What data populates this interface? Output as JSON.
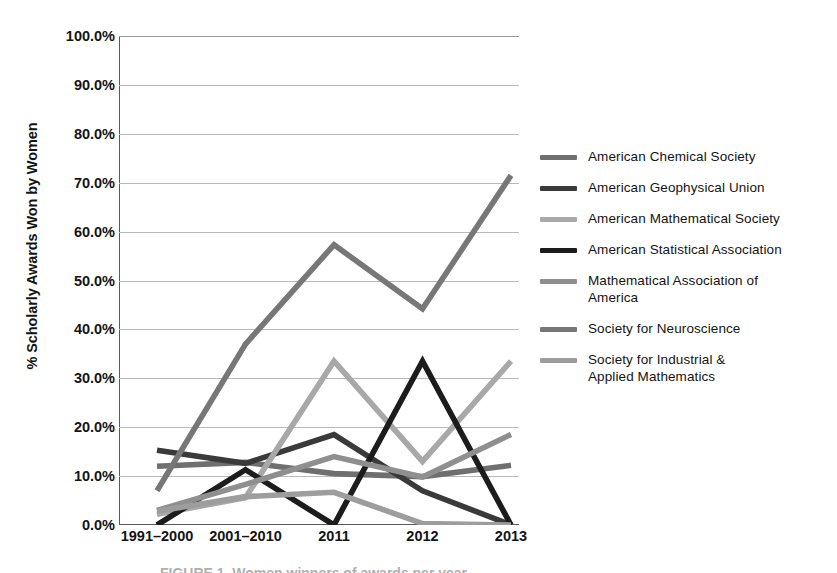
{
  "chart_data": {
    "type": "line",
    "title": "",
    "xlabel": "",
    "ylabel": "% Scholarly Awards Won by Women",
    "categories": [
      "1991–2000",
      "2001–2010",
      "2011",
      "2012",
      "2013"
    ],
    "ylim": [
      0,
      100
    ],
    "y_ticks": [
      "0.0%",
      "10.0%",
      "20.0%",
      "30.0%",
      "40.0%",
      "50.0%",
      "60.0%",
      "70.0%",
      "80.0%",
      "90.0%",
      "100.0%"
    ],
    "y_tick_values": [
      0,
      10,
      20,
      30,
      40,
      50,
      60,
      70,
      80,
      90,
      100
    ],
    "grid": true,
    "legend_position": "right",
    "series": [
      {
        "name": "American Chemical Society",
        "color": "#6f6f6f",
        "values": [
          12.0,
          12.8,
          10.5,
          9.9,
          12.2
        ]
      },
      {
        "name": "American Geophysical Union",
        "color": "#3a3a3a",
        "values": [
          15.3,
          12.6,
          18.5,
          7.0,
          0.0
        ]
      },
      {
        "name": "American Mathematical Society",
        "color": "#a8a8a8",
        "values": [
          2.2,
          5.6,
          33.5,
          13.0,
          33.5
        ]
      },
      {
        "name": "American Statistical Association",
        "color": "#1c1c1c",
        "values": [
          0.0,
          11.3,
          0.0,
          33.5,
          0.0
        ]
      },
      {
        "name": "Mathematical Association of\nAmerica",
        "color": "#8f8f8f",
        "values": [
          3.0,
          8.3,
          14.0,
          9.8,
          18.5
        ]
      },
      {
        "name": "Society for Neuroscience",
        "color": "#777777",
        "values": [
          7.0,
          37.0,
          57.3,
          44.2,
          71.5
        ]
      },
      {
        "name": "Society for Industrial &\nApplied Mathematics",
        "color": "#9d9d9d",
        "values": [
          2.8,
          5.8,
          6.7,
          0.3,
          0.0
        ]
      }
    ]
  },
  "axis": {
    "y_title": "% Scholarly Awards Won by Women"
  },
  "caption": {
    "sliver_text": "FIGURE 1. Women winners of awards per year"
  }
}
